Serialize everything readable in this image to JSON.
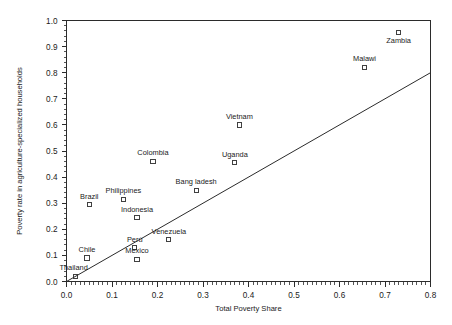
{
  "chart_data": {
    "type": "scatter",
    "title": "",
    "xlabel": "Total Poverty Share",
    "ylabel": "Poverty rate in agriculture-specialized households",
    "xlim": [
      0.0,
      0.8
    ],
    "ylim": [
      0.0,
      1.0
    ],
    "xticks": [
      "0.0",
      "0.1",
      "0.2",
      "0.3",
      "0.4",
      "0.5",
      "0.6",
      "0.7",
      "0.8"
    ],
    "xtick_values": [
      0.0,
      0.1,
      0.2,
      0.3,
      0.4,
      0.5,
      0.6,
      0.7,
      0.8
    ],
    "yticks": [
      "0.0",
      "0.1",
      "0.2",
      "0.3",
      "0.4",
      "0.5",
      "0.6",
      "0.7",
      "0.8",
      "0.9",
      "1.0"
    ],
    "ytick_values": [
      0.0,
      0.1,
      0.2,
      0.3,
      0.4,
      0.5,
      0.6,
      0.7,
      0.8,
      0.9,
      1.0
    ],
    "grid": false,
    "legend": "none",
    "marker_style": "open-square",
    "marker_color": "#2b2b2b",
    "points": [
      {
        "label": "Thailand",
        "x": 0.02,
        "y": 0.02,
        "label_dx": -2,
        "label_dy": -6
      },
      {
        "label": "Chile",
        "x": 0.045,
        "y": 0.09,
        "label_dx": 0,
        "label_dy": -6
      },
      {
        "label": "Brazil",
        "x": 0.05,
        "y": 0.295,
        "label_dx": 0,
        "label_dy": -6
      },
      {
        "label": "Philippines",
        "x": 0.125,
        "y": 0.315,
        "label_dx": 0,
        "label_dy": -6
      },
      {
        "label": "Indonesia",
        "x": 0.155,
        "y": 0.245,
        "label_dx": 0,
        "label_dy": -6
      },
      {
        "label": "Perú",
        "x": 0.15,
        "y": 0.13,
        "label_dx": 0,
        "label_dy": -6
      },
      {
        "label": "Mexico",
        "x": 0.155,
        "y": 0.085,
        "label_dx": 0,
        "label_dy": -6
      },
      {
        "label": "Venezuela",
        "x": 0.225,
        "y": 0.16,
        "label_dx": 0,
        "label_dy": -6
      },
      {
        "label": "Colombia",
        "x": 0.19,
        "y": 0.46,
        "label_dx": 0,
        "label_dy": -6
      },
      {
        "label": "Bang ladesh",
        "x": 0.285,
        "y": 0.35,
        "label_dx": 0,
        "label_dy": -6
      },
      {
        "label": "Uganda",
        "x": 0.37,
        "y": 0.455,
        "label_dx": 0,
        "label_dy": -6
      },
      {
        "label": "Vietnam",
        "x": 0.38,
        "y": 0.6,
        "label_dx": 0,
        "label_dy": -6
      },
      {
        "label": "Malawi",
        "x": 0.655,
        "y": 0.82,
        "label_dx": 0,
        "label_dy": -6
      },
      {
        "label": "Zambia",
        "x": 0.73,
        "y": 0.955,
        "label_dx": 0,
        "label_dy": 11
      }
    ],
    "trend_line": {
      "x0": 0.0,
      "y0": 0.0,
      "x1": 0.8,
      "y1": 0.8,
      "color": "#2b2b2b"
    }
  }
}
